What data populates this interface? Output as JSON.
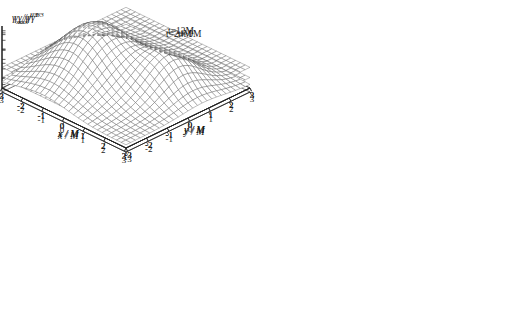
{
  "figure": {
    "background": "#ffffff",
    "mesh_color": "#555555",
    "axis_color": "#222222",
    "zaxis_label_parts": {
      "gamma": "γ",
      "subscript": "xx",
      "slash": "/",
      "gamma2": "γ",
      "exponent": "1/3"
    }
  },
  "axes": {
    "x_label": "x / M",
    "y_label": "y / M",
    "x_ticks": [
      "-3",
      "-2",
      "-1",
      "0",
      "1",
      "2",
      "3"
    ],
    "y_ticks": [
      "-3",
      "-2",
      "-1",
      "0",
      "1",
      "2",
      "3"
    ],
    "x_range": [
      -3,
      3
    ],
    "y_range": [
      -3,
      3
    ]
  },
  "panels": [
    {
      "id": "panel-0",
      "time_label": "t= 0M",
      "z_ticks": [
        "1.2",
        "1.1",
        "1",
        "0.9"
      ],
      "z_tick_values": [
        1.2,
        1.1,
        1.0,
        0.9
      ],
      "z_range": [
        0.88,
        1.24
      ],
      "surface": {
        "base": 1.0,
        "peaks": [
          {
            "x": 0.55,
            "y": 0.0,
            "amp": 0.19,
            "sx": 0.62,
            "sy": 0.62
          },
          {
            "x": -0.6,
            "y": 0.0,
            "amp": -0.055,
            "sx": 0.8,
            "sy": 0.8
          }
        ]
      }
    },
    {
      "id": "panel-1",
      "time_label": "t=12M",
      "z_ticks": [
        "12",
        "10",
        "8",
        "6",
        "4",
        "2",
        "0"
      ],
      "z_tick_values": [
        12,
        10,
        8,
        6,
        4,
        2,
        0
      ],
      "z_range": [
        0,
        13
      ],
      "surface": {
        "base": 2.2,
        "peaks": [
          {
            "x": -0.95,
            "y": -0.35,
            "amp": 10.2,
            "sx": 0.72,
            "sy": 0.8
          },
          {
            "x": 1.0,
            "y": 0.45,
            "amp": 8.4,
            "sx": 0.72,
            "sy": 0.8
          }
        ]
      }
    },
    {
      "id": "panel-2",
      "time_label": "t=24M",
      "z_ticks": [
        "40",
        "30",
        "20",
        "10"
      ],
      "z_tick_values": [
        40,
        30,
        20,
        10
      ],
      "z_range": [
        0,
        46
      ],
      "surface": {
        "base": 5.0,
        "peaks": [
          {
            "x": -1.05,
            "y": -0.5,
            "amp": 38.0,
            "sx": 1.25,
            "sy": 1.35
          },
          {
            "x": 1.35,
            "y": 0.75,
            "amp": 22.0,
            "sx": 0.85,
            "sy": 1.0
          }
        ]
      }
    }
  ],
  "chart_data": {
    "type": "line",
    "title": "",
    "subtitle": "",
    "xlabel": "x / M",
    "ylabel": "y / M",
    "zlabel": "γxx/γ^(1/3)",
    "grid": true,
    "legend_position": "none",
    "projection": "3d-wireframe-surface",
    "panel_count": 3,
    "annotations": [
      "t= 0M",
      "t=12M",
      "t=24M"
    ],
    "xlim": [
      -3,
      3
    ],
    "ylim": [
      -3,
      3
    ],
    "series": [
      {
        "name": "t= 0M",
        "zlim": [
          0.88,
          1.24
        ],
        "z_tick_labels": [
          "1.2",
          "1.1",
          "1",
          "0.9"
        ],
        "description": "flat plane at gamma_xx/gamma^(1/3) = 1 with a single localized bump rising to about 1.2 near x=0.5,y=0 and a shallow depression just inside it",
        "peak_height": 1.2,
        "baseline": 1.0
      },
      {
        "name": "t=12M",
        "zlim": [
          0,
          13
        ],
        "z_tick_labels": [
          "12",
          "10",
          "8",
          "6",
          "4",
          "2",
          "0"
        ],
        "description": "two separated narrow peaks rising from a low base of about 2; left/far peak reaches about 12, right/near peak about 10",
        "peak_heights": [
          12,
          10
        ],
        "baseline": 2
      },
      {
        "name": "t=24M",
        "zlim": [
          0,
          46
        ],
        "z_tick_labels": [
          "40",
          "30",
          "20",
          "10"
        ],
        "description": "two broad merged peaks from a base of about 5; the larger left peak reaches about 43, the smaller right peak about 27",
        "peak_heights": [
          43,
          27
        ],
        "baseline": 5
      }
    ]
  }
}
